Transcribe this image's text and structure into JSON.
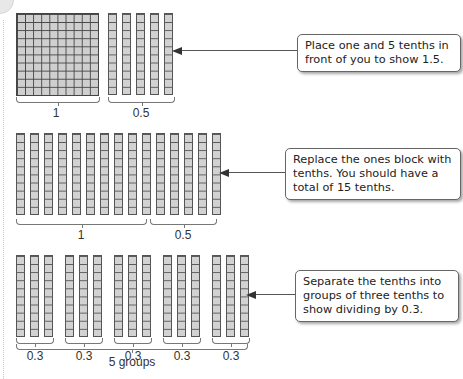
{
  "diagram": {
    "colors": {
      "block_fill": "#cfcfcf",
      "block_line": "#444444",
      "note_border": "#666666",
      "text": "#222222"
    },
    "steps": [
      {
        "id": "step1",
        "note": "Place one and 5 tenths in front of you to show 1.5.",
        "blocks": {
          "hundred_squares": 1,
          "tenth_rods": 5
        },
        "brace_labels": [
          "1",
          "0.5"
        ]
      },
      {
        "id": "step2",
        "note": "Replace the ones block with tenths. You should have a total of 15 tenths.",
        "blocks": {
          "tenth_rods": 15
        },
        "brace_labels": [
          "1",
          "0.5"
        ]
      },
      {
        "id": "step3",
        "note": "Separate the tenths into groups of three tenths to show dividing by 0.3.",
        "blocks": {
          "groups": 5,
          "rods_per_group": 3
        },
        "brace_labels": [
          "0.3",
          "0.3",
          "0.3",
          "0.3",
          "0.3"
        ],
        "outer_label": "5 groups"
      }
    ]
  }
}
